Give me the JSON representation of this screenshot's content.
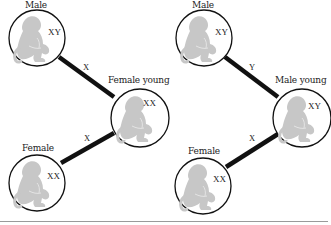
{
  "diagram": {
    "panels": [
      {
        "id": "left",
        "nodes": [
          {
            "label": "Male",
            "chromosomes": "XY"
          },
          {
            "label": "Female young",
            "chromosomes": "XX"
          },
          {
            "label": "Female",
            "chromosomes": "XX"
          }
        ],
        "links": [
          {
            "from": "Male",
            "to": "Female young",
            "label": "X"
          },
          {
            "from": "Female",
            "to": "Female young",
            "label": "X"
          }
        ]
      },
      {
        "id": "right",
        "nodes": [
          {
            "label": "Male",
            "chromosomes": "XY"
          },
          {
            "label": "Male young",
            "chromosomes": "XY"
          },
          {
            "label": "Female",
            "chromosomes": "XX"
          }
        ],
        "links": [
          {
            "from": "Male",
            "to": "Male young",
            "label": "Y"
          },
          {
            "from": "Female",
            "to": "Male young",
            "label": "X"
          }
        ]
      }
    ],
    "icons": {
      "node": "monkey-icon"
    },
    "colors": {
      "stroke": "#111111",
      "monkey": "#c4c4c4",
      "rule": "#9a9a9a"
    }
  }
}
